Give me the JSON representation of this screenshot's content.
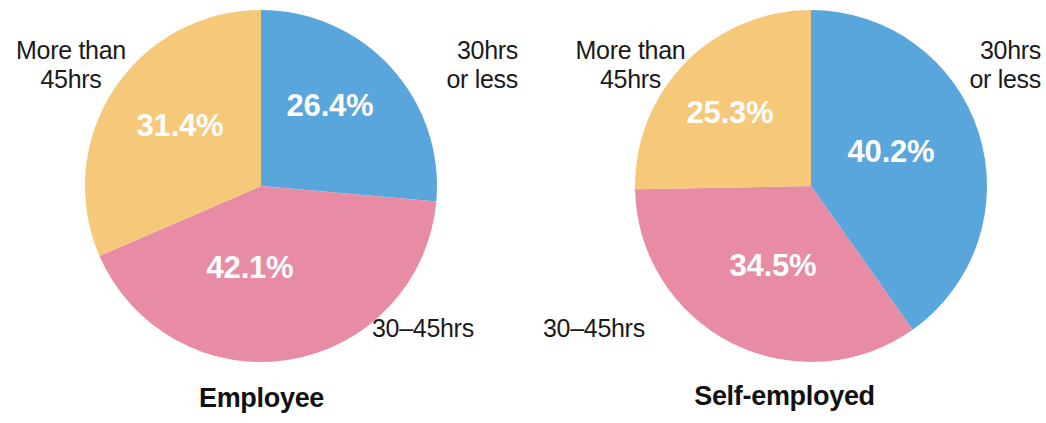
{
  "figure": {
    "background": "#ffffff",
    "width": 1046,
    "height": 423
  },
  "colors": {
    "blue": "#59A6DC",
    "pink": "#E78CA4",
    "yellow": "#F6C87A",
    "value_text": "#ffffff",
    "label_text": "#1a1a1a",
    "title_text": "#111111"
  },
  "charts": [
    {
      "id": "employee",
      "title": "Employee",
      "center": {
        "x": 261,
        "y": 186
      },
      "radius": 176,
      "slices": [
        {
          "label": "30hrs or less",
          "label_line1": "30hrs",
          "label_line2": "or less",
          "value": 26.4,
          "value_text": "26.4%",
          "color": "#59A6DC",
          "start_angle": 0,
          "end_angle": 95.04,
          "value_x": 330,
          "value_y": 108
        },
        {
          "label": "30–45hrs",
          "label_line1": "30–45hrs",
          "label_line2": "",
          "value": 42.1,
          "value_text": "42.1%",
          "color": "#E78CA4",
          "start_angle": 95.04,
          "end_angle": 246.6,
          "value_x": 250,
          "value_y": 270
        },
        {
          "label": "More than 45hrs",
          "label_line1": "More than",
          "label_line2": "45hrs",
          "value": 31.4,
          "value_text": "31.4%",
          "color": "#F6C87A",
          "start_angle": 246.6,
          "end_angle": 360,
          "value_x": 180,
          "value_y": 128
        }
      ]
    },
    {
      "id": "self-employed",
      "title": "Self-employed",
      "center": {
        "x": 288,
        "y": 186
      },
      "radius": 176,
      "slices": [
        {
          "label": "30hrs or less",
          "label_line1": "30hrs",
          "label_line2": "or less",
          "value": 40.2,
          "value_text": "40.2%",
          "color": "#59A6DC",
          "start_angle": 0,
          "end_angle": 144.72,
          "value_x": 368,
          "value_y": 154
        },
        {
          "label": "30–45hrs",
          "label_line1": "30–45hrs",
          "label_line2": "",
          "value": 34.5,
          "value_text": "34.5%",
          "color": "#E78CA4",
          "start_angle": 144.72,
          "end_angle": 268.92,
          "value_x": 250,
          "value_y": 268
        },
        {
          "label": "More than 45hrs",
          "label_line1": "More than",
          "label_line2": "45hrs",
          "value": 25.3,
          "value_text": "25.3%",
          "color": "#F6C87A",
          "start_angle": 268.92,
          "end_angle": 360,
          "value_x": 207,
          "value_y": 115
        }
      ]
    }
  ],
  "annotations": {
    "employee": {
      "more_than_45hrs": {
        "x": 6,
        "y": 36,
        "w": 130,
        "align": "center"
      },
      "hrs_30_or_less": {
        "x": 386,
        "y": 36,
        "w": 132,
        "align": "right"
      },
      "hrs_30_45": {
        "x": 372,
        "y": 314,
        "w": 130,
        "align": "left"
      },
      "title_y": 383
    },
    "self_employed": {
      "more_than_45hrs": {
        "x": 40,
        "y": 36,
        "w": 135,
        "align": "center"
      },
      "hrs_30_or_less": {
        "x": 395,
        "y": 36,
        "w": 123,
        "align": "right"
      },
      "hrs_30_45": {
        "x": 20,
        "y": 314,
        "w": 140,
        "align": "left"
      },
      "title_y": 381
    }
  },
  "chart_data": {
    "type": "pie",
    "title": "",
    "subtitle": "",
    "categories": [
      "30hrs or less",
      "30–45hrs",
      "More than 45hrs"
    ],
    "unit": "%",
    "legend_position": "around-slices",
    "series": [
      {
        "name": "Employee",
        "values": [
          26.4,
          42.1,
          31.4
        ]
      },
      {
        "name": "Self-employed",
        "values": [
          40.2,
          34.5,
          25.3
        ]
      }
    ],
    "colors": [
      "#59A6DC",
      "#E78CA4",
      "#F6C87A"
    ],
    "start_angle_deg": 0,
    "direction": "clockwise",
    "annotations": [
      "26.4%",
      "42.1%",
      "31.4%",
      "40.2%",
      "34.5%",
      "25.3%"
    ]
  }
}
